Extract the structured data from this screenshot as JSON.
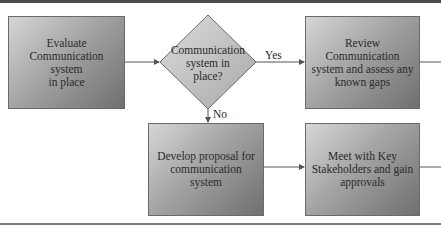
{
  "diagram": {
    "type": "flowchart",
    "nodes": {
      "evaluate": "Evaluate Communication system in place",
      "decision": "Communication system in place?",
      "review": "Review Communication system and assess any known gaps",
      "develop": "Develop proposal for communication system",
      "meet": "Meet with Key Stakeholders and gain approvals"
    },
    "node_lines": {
      "evaluate": [
        "Evaluate",
        "Communication system",
        "in place"
      ],
      "decision": [
        "Communication",
        "system in",
        "place?"
      ],
      "review": [
        "Review Communication",
        "system and assess any",
        "known gaps"
      ],
      "develop": [
        "Develop proposal for",
        "communication system"
      ],
      "meet": [
        "Meet with Key",
        "Stakeholders and gain",
        "approvals"
      ]
    },
    "edges": [
      {
        "from": "evaluate",
        "to": "decision",
        "label": ""
      },
      {
        "from": "decision",
        "to": "review",
        "label": "Yes"
      },
      {
        "from": "decision",
        "to": "develop",
        "label": "No"
      },
      {
        "from": "develop",
        "to": "meet",
        "label": ""
      },
      {
        "from": "review",
        "to": "(continues off-page)",
        "label": ""
      },
      {
        "from": "meet",
        "to": "(continues off-page)",
        "label": ""
      }
    ],
    "edge_labels": {
      "yes": "Yes",
      "no": "No"
    },
    "colors": {
      "box_light": "#d6d6d6",
      "box_dark": "#6f6f6f",
      "diamond_fill": "#c8c8c8",
      "line": "#555555",
      "text": "#2a2a2a"
    }
  }
}
